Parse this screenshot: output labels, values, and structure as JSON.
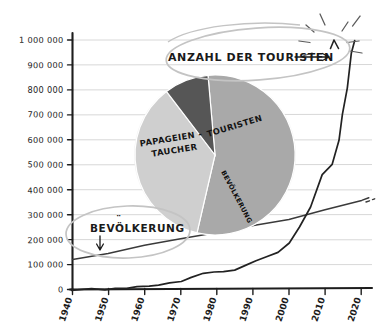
{
  "chart_data": {
    "type": "line",
    "title": "",
    "xlabel": "",
    "ylabel": "",
    "xlim": [
      1940,
      2023
    ],
    "ylim": [
      0,
      1000000
    ],
    "grid": true,
    "legend_position": "annotations",
    "xticks": [
      "1940",
      "1950",
      "1960",
      "1970",
      "1980",
      "1990",
      "2000",
      "2010",
      "2020"
    ],
    "yticks": [
      "0",
      "100 000",
      "200 000",
      "300 000",
      "400 000",
      "500 000",
      "600 000",
      "700 000",
      "800 000",
      "900 000",
      "1 000 000"
    ],
    "series": [
      {
        "name": "Anzahl der Touristen",
        "color": "#222222",
        "x": [
          1940,
          1945,
          1949,
          1952,
          1955,
          1958,
          1961,
          1964,
          1967,
          1970,
          1973,
          1976,
          1979,
          1982,
          1985,
          1988,
          1991,
          1994,
          1997,
          2000,
          2003,
          2006,
          2009,
          2012,
          2014,
          2015,
          2016,
          2017,
          2018
        ],
        "values": [
          500,
          900,
          2000,
          4000,
          6000,
          9000,
          13000,
          18000,
          24000,
          31000,
          45000,
          63000,
          70000,
          72000,
          80000,
          95000,
          115000,
          128000,
          150000,
          190000,
          250000,
          330000,
          460000,
          500000,
          600000,
          700000,
          810000,
          950000,
          1000000
        ]
      },
      {
        "name": "Bevölkerung",
        "color": "#3a3a3a",
        "x": [
          1940,
          1950,
          1960,
          1970,
          1980,
          1990,
          2000,
          2010,
          2020,
          2022
        ],
        "values": [
          121000,
          143000,
          176000,
          204000,
          228000,
          255000,
          281000,
          318000,
          357000,
          368000
        ]
      }
    ],
    "pie": {
      "type": "pie",
      "title": "",
      "slices": [
        {
          "label": "Papageientaucher",
          "value": 55,
          "color": "#a9a9a9"
        },
        {
          "label": "Touristen",
          "value": 36,
          "color": "#cfcfcf"
        },
        {
          "label": "Bevölkerung",
          "value": 9,
          "color": "#565656"
        }
      ]
    },
    "annotations": [
      {
        "text": "ANZAHL DER TOURISTEN",
        "target": "tourist-curve-peak",
        "marker": "arrow-right",
        "highlight": "ellipse"
      },
      {
        "text": "BEVÖLKERUNG",
        "target": "population-line",
        "marker": "arrow-down",
        "highlight": "ellipse"
      }
    ]
  },
  "axis": {
    "y_labels": [
      "1 000 000",
      "900 000",
      "800 000",
      "700 000",
      "600 000",
      "500 000",
      "400 000",
      "300 000",
      "200 000",
      "100 000",
      "0"
    ],
    "x_labels": [
      "1940",
      "1950",
      "1960",
      "1970",
      "1980",
      "1990",
      "2000",
      "2010",
      "2020"
    ]
  },
  "pie_labels": {
    "papageientaucher_line1": "PAPAGEIEN -",
    "papageientaucher_line2": "TAUCHER",
    "touristen": "TOURISTEN",
    "bevoelkerung": "BEVÖLKERUNG"
  },
  "annotations": {
    "tourists": "ANZAHL DER TOURISTEN",
    "population": "BEVÖLKERUNG"
  },
  "colors": {
    "background": "#ffffff",
    "axis": "#1d1d1d",
    "grid": "#d8d8d8",
    "tourist_line": "#232323",
    "population_line": "#3c3c3c",
    "pie_large": "#a9a9a9",
    "pie_medium": "#cfcfcf",
    "pie_small": "#565656",
    "highlight": "#c4c4c4"
  }
}
